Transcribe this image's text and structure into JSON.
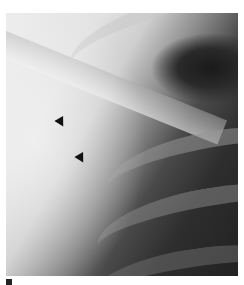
{
  "image": {
    "type": "radiograph",
    "description": "Chest X-ray detail showing upper ribs and clavicle with two arrowheads marking a finding",
    "colors": {
      "background": "#ffffff",
      "dark": "#222222",
      "light": "#ececec",
      "arrow": "#111111"
    }
  },
  "annotations": [
    {
      "type": "arrowhead",
      "direction": "down-right",
      "x": 62,
      "y": 124
    },
    {
      "type": "arrowhead",
      "direction": "down-right",
      "x": 82,
      "y": 159
    }
  ]
}
